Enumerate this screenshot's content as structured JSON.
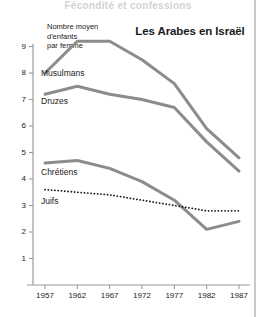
{
  "cut_header_text": "Fécondité et confessions",
  "title": "Les Arabes en Israël",
  "axis_caption": {
    "line1": "Nombre moyen",
    "line2": "d'enfants",
    "line3": "par femme"
  },
  "labels": {
    "musulmans": "Musulmans",
    "druzes": "Druzes",
    "chretiens": "Chrétiens",
    "juifs": "Juifs"
  },
  "colors": {
    "line": "#8c8c8c",
    "axis": "#9a9a9a",
    "text": "#1b1b1b",
    "dotted": "#1b1b1b"
  },
  "chart_data": {
    "type": "line",
    "title": "Les Arabes en Israël",
    "xlabel": "",
    "ylabel": "Nombre moyen d'enfants par femme",
    "x": [
      1957,
      1962,
      1967,
      1972,
      1977,
      1982,
      1987
    ],
    "xticklabels": [
      "1957",
      "1962",
      "1967",
      "1972",
      "1977",
      "1982",
      "1987"
    ],
    "xlim": [
      1957,
      1987
    ],
    "ylim": [
      0,
      9.4
    ],
    "yticks": [
      1,
      2,
      3,
      4,
      5,
      6,
      7,
      8,
      9
    ],
    "yticklabels": [
      "1",
      "2",
      "3",
      "4",
      "5",
      "6",
      "7",
      "8",
      "9"
    ],
    "grid": false,
    "legend": "inline-labels",
    "series": [
      {
        "name": "Musulmans",
        "style": "solid",
        "color": "#8c8c8c",
        "values": [
          8.0,
          9.2,
          9.2,
          8.5,
          7.6,
          5.9,
          4.8
        ]
      },
      {
        "name": "Druzes",
        "style": "solid",
        "color": "#8c8c8c",
        "values": [
          7.2,
          7.5,
          7.2,
          7.0,
          6.7,
          5.4,
          4.3
        ]
      },
      {
        "name": "Chrétiens",
        "style": "solid",
        "color": "#8c8c8c",
        "values": [
          4.6,
          4.7,
          4.4,
          3.9,
          3.2,
          2.1,
          2.4
        ]
      },
      {
        "name": "Juifs",
        "style": "dotted",
        "color": "#1b1b1b",
        "values": [
          3.6,
          3.5,
          3.4,
          3.2,
          3.0,
          2.8,
          2.8
        ]
      }
    ]
  }
}
